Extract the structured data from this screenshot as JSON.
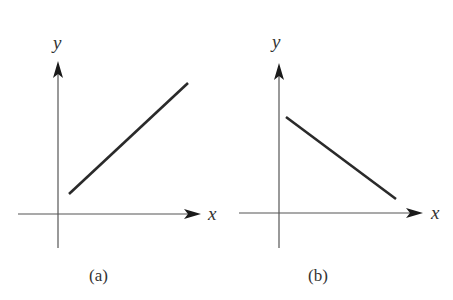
{
  "figure": {
    "panels": [
      {
        "caption": "(a)",
        "x_label": "x",
        "y_label": "y",
        "line_slope": "positive",
        "description": "Line with positive slope, positive y-intercept region, in first quadrant"
      },
      {
        "caption": "(b)",
        "x_label": "x",
        "y_label": "y",
        "line_slope": "negative",
        "description": "Line with negative slope, starting near y-axis and descending toward x-axis"
      }
    ]
  },
  "colors": {
    "axis": "#555555",
    "line": "#2a2a2a",
    "text": "#333333",
    "background": "#ffffff"
  }
}
